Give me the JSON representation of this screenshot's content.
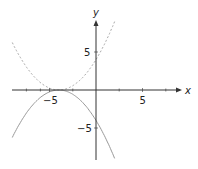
{
  "chart_data": {
    "type": "line",
    "title": "",
    "xlabel": "x",
    "ylabel": "y",
    "xlim": [
      -9.5,
      8.5
    ],
    "ylim": [
      -10.5,
      11
    ],
    "xticks": [
      -5,
      5
    ],
    "yticks": [
      5,
      -5
    ],
    "xtick_labels": [
      "−5",
      "5"
    ],
    "ytick_labels": [
      "5",
      "−5"
    ],
    "grid": false,
    "series": [
      {
        "name": "y = (x+4)^2/4",
        "style": "dashed",
        "color": "#aaaaaa",
        "x": [
          -9,
          -8,
          -7,
          -6,
          -5,
          -4,
          -3,
          -2,
          -1,
          0,
          1,
          2
        ],
        "values": [
          6.25,
          4,
          2.25,
          1,
          0.25,
          0,
          0.25,
          1,
          2.25,
          4,
          6.25,
          9
        ]
      },
      {
        "name": "y = -(x+4)^2/4",
        "style": "solid",
        "color": "#999999",
        "x": [
          -9,
          -8,
          -7,
          -6,
          -5,
          -4,
          -3,
          -2,
          -1,
          0,
          1,
          2
        ],
        "values": [
          -6.25,
          -4,
          -2.25,
          -1,
          -0.25,
          0,
          -0.25,
          -1,
          -2.25,
          -4,
          -6.25,
          -9
        ]
      }
    ]
  },
  "axes": {
    "x_label": "x",
    "y_label": "y",
    "x_tick_neg": "−5",
    "x_tick_pos": "5",
    "y_tick_pos": "5",
    "y_tick_neg": "−5"
  },
  "colors": {
    "axis": "#333333",
    "dashed_curve": "#aaaaaa",
    "solid_curve": "#999999"
  }
}
